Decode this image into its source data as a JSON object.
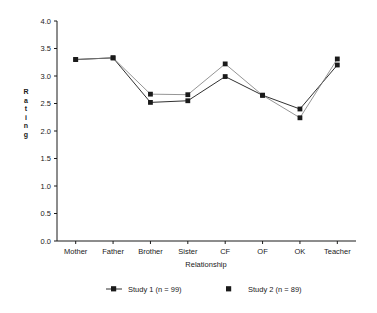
{
  "chart_data": {
    "type": "line",
    "title": "",
    "xlabel": "Relationship",
    "ylabel": "Rating",
    "ylabel_letters": [
      "R",
      "a",
      "t",
      "i",
      "n",
      "g"
    ],
    "categories": [
      "Mother",
      "Father",
      "Brother",
      "Sister",
      "CF",
      "OF",
      "OK",
      "Teacher"
    ],
    "ylim": [
      0.0,
      4.0
    ],
    "yticks": [
      "0.0",
      "0.5",
      "1.0",
      "1.5",
      "2.0",
      "2.5",
      "3.0",
      "3.5",
      "4.0"
    ],
    "ytick_values": [
      0.0,
      0.5,
      1.0,
      1.5,
      2.0,
      2.5,
      3.0,
      3.5,
      4.0
    ],
    "grid": false,
    "legend_position": "bottom",
    "series": [
      {
        "name": "Study 1 (n = 99)",
        "marker": "square-with-line",
        "color": "#1a1a1a",
        "values": [
          3.3,
          3.33,
          2.52,
          2.55,
          2.99,
          2.65,
          2.4,
          3.2
        ]
      },
      {
        "name": "Study 2 (n = 89)",
        "marker": "square",
        "color": "#1a1a1a",
        "values": [
          3.3,
          3.33,
          2.67,
          2.66,
          3.22,
          2.65,
          2.24,
          3.31
        ]
      }
    ]
  }
}
